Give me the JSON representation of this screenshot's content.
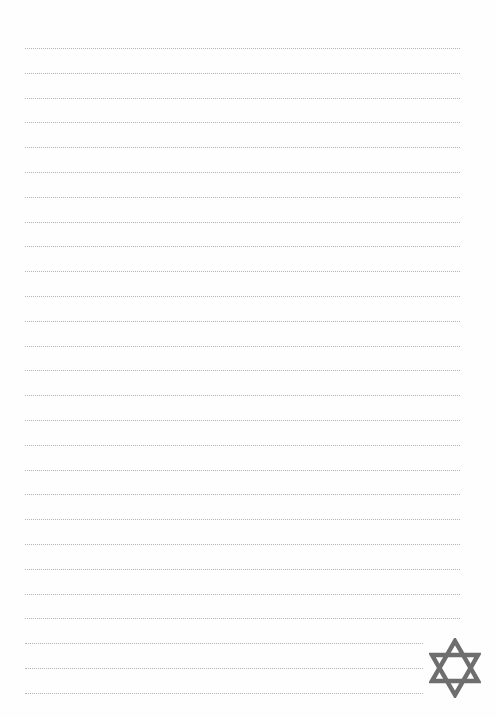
{
  "page": {
    "type": "lined-writing-paper",
    "background_color": "#ffffff",
    "line_color": "#b5b5b5",
    "line_style": "dotted",
    "line_count": 27,
    "first_line_y": 48,
    "line_spacing": 24.8,
    "line_left": 25,
    "line_right_full": 460,
    "line_right_short": 423,
    "short_lines_from_index": 24
  },
  "decoration": {
    "icon": "star-of-david-icon",
    "color": "#6e6e6e",
    "position": "bottom-right"
  }
}
